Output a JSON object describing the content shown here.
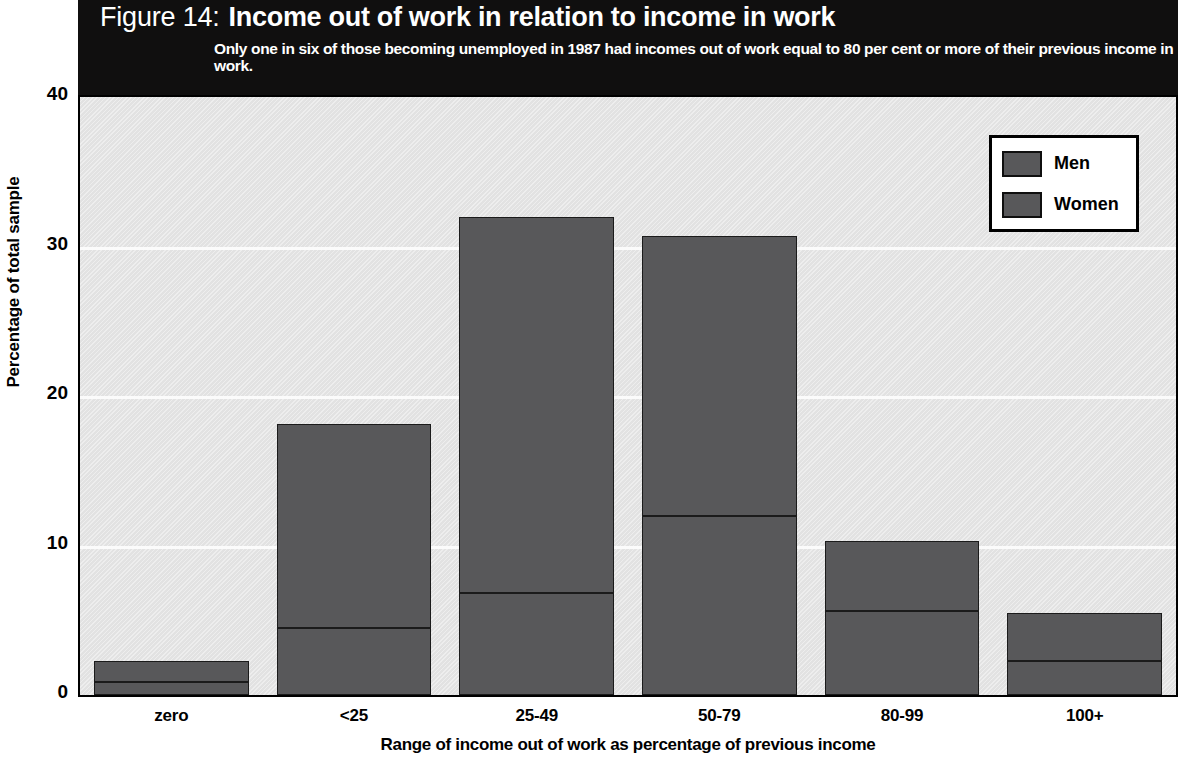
{
  "header": {
    "figure_number": "Figure 14:",
    "title": "Income out of work in relation to income in work",
    "subtitle": "Only one in six of those becoming unemployed in 1987 had incomes out of work equal to 80 per cent or more of their previous income in work."
  },
  "legend": {
    "items": [
      {
        "label": "Men",
        "color": "#58585a"
      },
      {
        "label": "Women",
        "color": "#58585a"
      }
    ]
  },
  "axes": {
    "y_title": "Percentage of total sample",
    "x_title": "Range of income out of work as percentage of previous income",
    "y_ticks": [
      "0",
      "10",
      "20",
      "30",
      "40"
    ]
  },
  "chart_data": {
    "type": "bar",
    "subtype": "stacked",
    "title": "Income out of work in relation to income in work",
    "subtitle": "Only one in six of those becoming unemployed in 1987 had incomes out of work equal to 80 per cent or more of their previous income in work.",
    "xlabel": "Range of income out of work as percentage of previous income",
    "ylabel": "Percentage of total sample",
    "ylim": [
      0,
      40
    ],
    "yticks": [
      0,
      10,
      20,
      30,
      40
    ],
    "grid": true,
    "legend_position": "top-right",
    "categories": [
      "zero",
      "<25",
      "25-49",
      "50-79",
      "80-99",
      "100+"
    ],
    "series": [
      {
        "name": "Women",
        "color": "#58585a",
        "values": [
          0.9,
          4.5,
          6.8,
          12.0,
          5.6,
          2.3
        ]
      },
      {
        "name": "Men",
        "color": "#58585a",
        "values": [
          1.4,
          13.6,
          25.2,
          18.7,
          4.7,
          3.2
        ]
      }
    ],
    "totals": [
      2.3,
      18.1,
      32.0,
      30.7,
      10.3,
      5.5
    ]
  }
}
